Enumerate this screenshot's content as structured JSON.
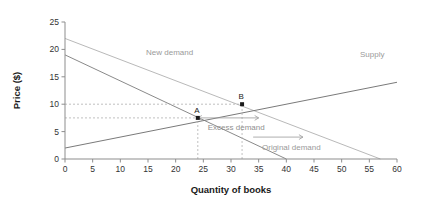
{
  "chart_data": {
    "type": "line",
    "title": "",
    "xlabel": "Quantity of books",
    "ylabel": "Price ($)",
    "xlim": [
      0,
      60
    ],
    "ylim": [
      0,
      25
    ],
    "xticks": [
      0,
      5,
      10,
      15,
      20,
      25,
      30,
      35,
      40,
      45,
      50,
      55,
      60
    ],
    "yticks": [
      0,
      5,
      10,
      15,
      20,
      25
    ],
    "grid": false,
    "legend_position": "inline-labels",
    "series": [
      {
        "name": "Supply",
        "label": "Supply",
        "color": "#7a7a7a",
        "points": [
          [
            0,
            2
          ],
          [
            60,
            14
          ]
        ]
      },
      {
        "name": "Original demand",
        "label": "Original demand",
        "color": "#8a8a8a",
        "points": [
          [
            0,
            19
          ],
          [
            40,
            0
          ]
        ]
      },
      {
        "name": "New demand",
        "label": "New demand",
        "color": "#b9b9b9",
        "points": [
          [
            0,
            22
          ],
          [
            57,
            0
          ]
        ]
      }
    ],
    "points_of_interest": [
      {
        "label": "A",
        "x": 24,
        "y": 7.5,
        "description": "original equilibrium"
      },
      {
        "label": "B",
        "x": 32,
        "y": 10,
        "description": "new equilibrium"
      }
    ],
    "guides": [
      {
        "orientation": "horizontal",
        "value": 10,
        "from": 0,
        "to": 32
      },
      {
        "orientation": "horizontal",
        "value": 7.5,
        "from": 0,
        "to": 24
      },
      {
        "orientation": "vertical",
        "value": 24,
        "from": 0,
        "to": 7.5
      },
      {
        "orientation": "vertical",
        "value": 32,
        "from": 0,
        "to": 10
      }
    ],
    "annotations": [
      {
        "text": "Excess demand",
        "type": "double-arrow",
        "y": 7.5,
        "x_start": 24,
        "x_end": 35
      },
      {
        "text": "",
        "type": "right-arrow",
        "y": 4.0,
        "x_start": 34,
        "x_end": 43
      }
    ]
  },
  "axes": {
    "x_title": "Quantity of books",
    "y_title": "Price ($)",
    "x_tick_labels": [
      "0",
      "5",
      "10",
      "15",
      "20",
      "25",
      "30",
      "35",
      "40",
      "45",
      "50",
      "55",
      "60"
    ],
    "y_tick_labels": [
      "0",
      "5",
      "10",
      "15",
      "20",
      "25"
    ]
  },
  "labels": {
    "supply": "Supply",
    "original_demand": "Original demand",
    "new_demand": "New demand",
    "point_a": "A",
    "point_b": "B",
    "excess_demand": "Excess demand"
  },
  "colors": {
    "supply": "#7a7a7a",
    "original_demand": "#8a8a8a",
    "new_demand": "#b9b9b9",
    "axis": "#8d8d8d",
    "guide": "#b0b0b0",
    "text": "#333333",
    "annotation": "#8f8f8f",
    "background": "#ffffff"
  }
}
